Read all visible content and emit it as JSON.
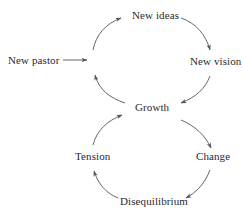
{
  "diagram": {
    "type": "cycle",
    "colors": {
      "text": "#2a2a2a",
      "arrow": "#555555",
      "background": "#ffffff"
    },
    "nodes": {
      "new_pastor": "New pastor",
      "new_ideas": "New ideas",
      "new_vision": "New vision",
      "growth": "Growth",
      "change": "Change",
      "disequilibrium": "Disequilibrium",
      "tension": "Tension"
    },
    "edges": [
      {
        "from": "New pastor",
        "to": "upper-loop"
      },
      {
        "from": "upper-loop",
        "to": "New ideas"
      },
      {
        "from": "New ideas",
        "to": "New vision"
      },
      {
        "from": "New vision",
        "to": "Growth"
      },
      {
        "from": "Growth",
        "to": "upper-loop"
      },
      {
        "from": "Growth",
        "to": "Change"
      },
      {
        "from": "Change",
        "to": "Disequilibrium"
      },
      {
        "from": "Disequilibrium",
        "to": "Tension"
      },
      {
        "from": "Tension",
        "to": "Growth"
      }
    ]
  }
}
